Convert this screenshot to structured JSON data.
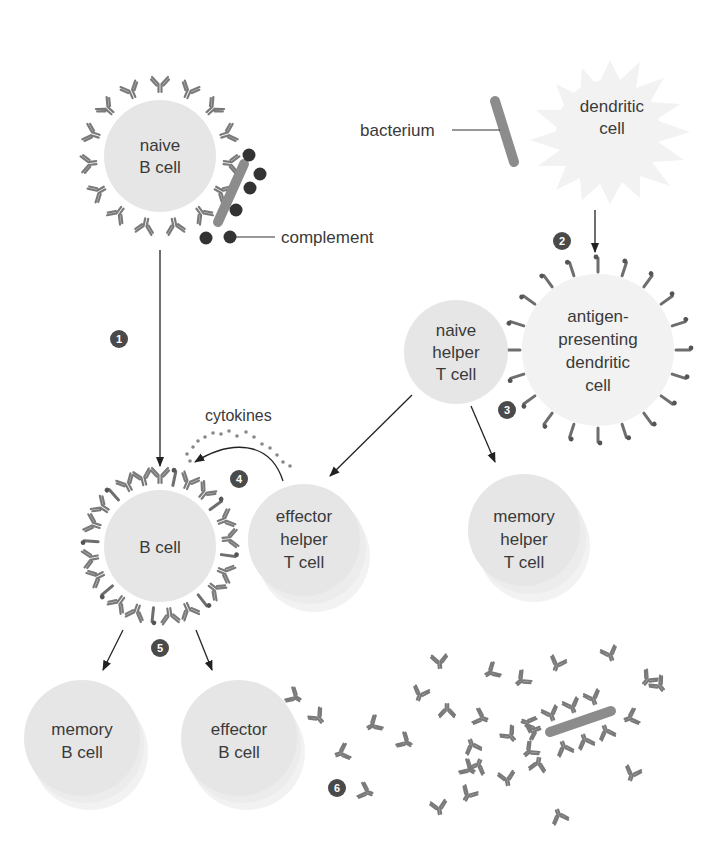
{
  "diagram": {
    "type": "immune-response-flow",
    "colors": {
      "cell_fill": "#e6e6e6",
      "antibody": "#7a7a7a",
      "bacterium": "#8c8c8c",
      "complement": "#333333",
      "badge": "#4a4a4a",
      "arrow": "#222222",
      "text": "#3a3a3a"
    },
    "cells": {
      "naive_b": {
        "line1": "naive",
        "line2": "B cell"
      },
      "dendritic": {
        "line1": "dendritic",
        "line2": "cell"
      },
      "apc": {
        "line1": "antigen-",
        "line2": "presenting",
        "line3": "dendritic",
        "line4": "cell"
      },
      "naive_helper_t": {
        "line1": "naive",
        "line2": "helper",
        "line3": "T cell"
      },
      "b_cell": {
        "line1": "B cell"
      },
      "effector_helper_t": {
        "line1": "effector",
        "line2": "helper",
        "line3": "T cell"
      },
      "memory_helper_t": {
        "line1": "memory",
        "line2": "helper",
        "line3": "T cell"
      },
      "memory_b": {
        "line1": "memory",
        "line2": "B cell"
      },
      "effector_b": {
        "line1": "effector",
        "line2": "B cell"
      }
    },
    "callouts": {
      "bacterium": "bacterium",
      "complement": "complement",
      "cytokines": "cytokines"
    },
    "steps": [
      "1",
      "2",
      "3",
      "4",
      "5",
      "6"
    ]
  }
}
